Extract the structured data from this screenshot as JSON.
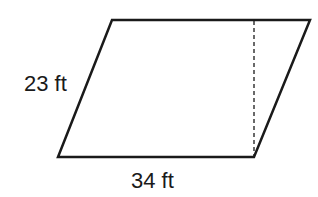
{
  "figure": {
    "shape": "parallelogram",
    "labels": {
      "side": "23 ft",
      "base": "34 ft"
    },
    "height_line": "dashed",
    "colors": {
      "stroke": "#1a1a1a",
      "background": "#ffffff"
    }
  }
}
